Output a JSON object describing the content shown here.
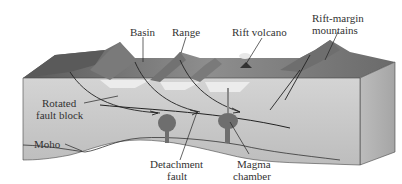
{
  "diagram": {
    "type": "block-diagram",
    "labels": {
      "basin": "Basin",
      "range": "Range",
      "rift_volcano": "Rift volcano",
      "rift_margin_line1": "Rift-margin",
      "rift_margin_line2": "mountains",
      "rotated_line1": "Rotated",
      "rotated_line2": "fault block",
      "moho": "Moho",
      "detachment_line1": "Detachment",
      "detachment_line2": "fault",
      "magma_line1": "Magma",
      "magma_line2": "chamber"
    },
    "colors": {
      "front_face": "#c9c9c9",
      "top_surface": "#8f8f8f",
      "top_dark": "#5e5e5e",
      "side_face": "#b3b3b3",
      "mountains": "#7a7a7a",
      "basin_fill": "#e8e8e8",
      "magma": "#6e6e6e",
      "lines": "#222222",
      "label_text": "#333333"
    }
  }
}
